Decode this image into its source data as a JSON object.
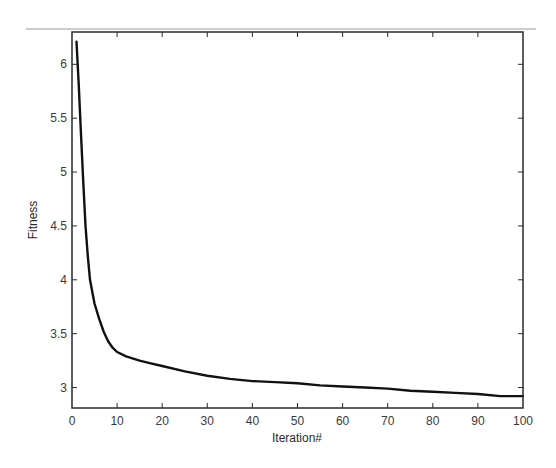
{
  "chart_data": {
    "type": "line",
    "title": "",
    "xlabel": "Iteration#",
    "ylabel": "Fitness",
    "xlim": [
      0,
      100
    ],
    "ylim": [
      2.81,
      6.3
    ],
    "xticks": [
      0,
      10,
      20,
      30,
      40,
      50,
      60,
      70,
      80,
      90,
      100
    ],
    "xtick_labels": [
      "0",
      "10",
      "20",
      "30",
      "40",
      "50",
      "60",
      "70",
      "80",
      "90",
      "100"
    ],
    "yticks": [
      3,
      3.5,
      4,
      4.5,
      5,
      5.5,
      6
    ],
    "ytick_labels": [
      "3",
      "3.5",
      "4",
      "4.5",
      "5",
      "5.5",
      "6"
    ],
    "grid": false,
    "legend": null,
    "series": [
      {
        "name": "Fitness",
        "color": "#111111",
        "x": [
          1,
          1.5,
          2,
          2.5,
          3,
          3.5,
          4,
          5,
          6,
          7,
          8,
          9,
          10,
          12,
          15,
          17,
          20,
          25,
          30,
          35,
          40,
          45,
          50,
          55,
          60,
          65,
          70,
          75,
          80,
          85,
          90,
          95,
          100
        ],
        "y": [
          6.21,
          5.8,
          5.35,
          4.9,
          4.5,
          4.22,
          4.0,
          3.78,
          3.64,
          3.52,
          3.43,
          3.37,
          3.33,
          3.29,
          3.25,
          3.23,
          3.2,
          3.15,
          3.11,
          3.08,
          3.06,
          3.05,
          3.04,
          3.02,
          3.01,
          3.0,
          2.99,
          2.97,
          2.96,
          2.95,
          2.94,
          2.92,
          2.92
        ]
      }
    ]
  },
  "colors": {
    "axis": "#2a2a2a",
    "line": "#111111",
    "top_rule": "#9a9a9a",
    "background": "#ffffff"
  }
}
